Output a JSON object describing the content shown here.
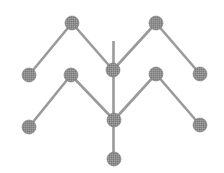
{
  "diagram": {
    "type": "node-link graph",
    "width": 224,
    "height": 173,
    "colors": {
      "background": "#ffffff",
      "node_fill": "#8c8c8c",
      "node_stroke": "#7a7a7a",
      "edge": "#9a9a9a"
    },
    "node_radius": 7,
    "edge_width": 2.6,
    "nodes": [
      {
        "id": "top_left_peak",
        "x": 72,
        "y": 23
      },
      {
        "id": "top_right_peak",
        "x": 156,
        "y": 23
      },
      {
        "id": "upper_left_end",
        "x": 29,
        "y": 75
      },
      {
        "id": "upper_center",
        "x": 113,
        "y": 70
      },
      {
        "id": "upper_right_end",
        "x": 200,
        "y": 74
      },
      {
        "id": "lower_left_peak",
        "x": 71,
        "y": 75
      },
      {
        "id": "lower_right_peak",
        "x": 156,
        "y": 74
      },
      {
        "id": "lower_left_end",
        "x": 29,
        "y": 127
      },
      {
        "id": "lower_center",
        "x": 114,
        "y": 120
      },
      {
        "id": "lower_right_end",
        "x": 200,
        "y": 125
      },
      {
        "id": "bottom",
        "x": 114,
        "y": 159
      }
    ],
    "edges": [
      {
        "from": "upper_left_end",
        "to": "top_left_peak"
      },
      {
        "from": "top_left_peak",
        "to": "upper_center"
      },
      {
        "from": "upper_center",
        "to": "top_right_peak"
      },
      {
        "from": "top_right_peak",
        "to": "upper_right_end"
      },
      {
        "from": "lower_left_end",
        "to": "lower_left_peak"
      },
      {
        "from": "lower_left_peak",
        "to": "lower_center"
      },
      {
        "from": "lower_center",
        "to": "lower_right_peak"
      },
      {
        "from": "lower_right_peak",
        "to": "lower_right_end"
      }
    ],
    "stem": {
      "x": 113.5,
      "y1": 41,
      "y2": 159
    }
  }
}
